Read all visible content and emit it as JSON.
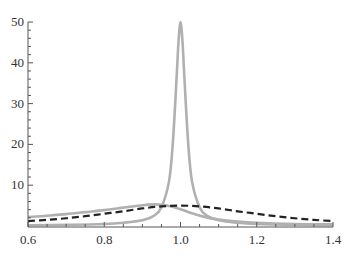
{
  "chart_data": {
    "type": "line",
    "title": "",
    "xlabel": "",
    "ylabel": "",
    "xlim": [
      0.6,
      1.4
    ],
    "ylim": [
      0,
      50
    ],
    "grid": false,
    "legend": null,
    "x_ticks": [
      "0.6",
      "0.8",
      "1.0",
      "1.2",
      "1.4"
    ],
    "y_ticks": [
      "10",
      "20",
      "30",
      "40",
      "50"
    ],
    "series": [
      {
        "name": "sharp-resonance",
        "style": "solid",
        "color": "#b0b0b0",
        "x": [
          0.6,
          0.7,
          0.8,
          0.85,
          0.9,
          0.93,
          0.95,
          0.97,
          0.98,
          0.99,
          0.995,
          1.0,
          1.005,
          1.01,
          1.02,
          1.03,
          1.05,
          1.07,
          1.1,
          1.15,
          1.2,
          1.3,
          1.4
        ],
        "y": [
          0.2,
          0.3,
          0.5,
          0.8,
          1.4,
          2.5,
          4.6,
          11.0,
          20.5,
          36.8,
          45.5,
          50.0,
          45.5,
          36.8,
          20.5,
          11.0,
          4.6,
          2.5,
          1.4,
          0.8,
          0.5,
          0.3,
          0.2
        ]
      },
      {
        "name": "broad-resonance",
        "style": "solid",
        "color": "#b0b0b0",
        "x": [
          0.6,
          0.65,
          0.7,
          0.75,
          0.8,
          0.85,
          0.9,
          0.93,
          0.95,
          0.97,
          1.0,
          1.03,
          1.06,
          1.1,
          1.15,
          1.2,
          1.3,
          1.4
        ],
        "y": [
          2.2,
          2.5,
          2.9,
          3.4,
          3.9,
          4.5,
          5.1,
          5.3,
          5.2,
          4.9,
          4.1,
          3.1,
          2.3,
          1.6,
          1.1,
          0.8,
          0.5,
          0.4
        ]
      },
      {
        "name": "dashed-approximation",
        "style": "dashed",
        "color": "#222222",
        "x": [
          0.6,
          0.65,
          0.7,
          0.75,
          0.8,
          0.85,
          0.9,
          0.95,
          1.0,
          1.05,
          1.1,
          1.15,
          1.2,
          1.25,
          1.3,
          1.35,
          1.4
        ],
        "y": [
          1.2,
          1.5,
          1.9,
          2.4,
          3.0,
          3.6,
          4.3,
          4.8,
          5.0,
          4.8,
          4.3,
          3.6,
          3.0,
          2.4,
          1.9,
          1.5,
          1.2
        ]
      }
    ]
  },
  "plot": {
    "left": 28,
    "right": 333,
    "top": 22,
    "bottom": 226
  }
}
